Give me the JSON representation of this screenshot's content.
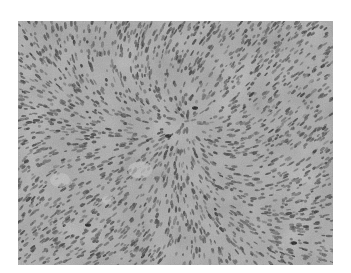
{
  "image": {
    "kind": "grayscale histology micrograph",
    "description": "Dense field of spindle-shaped cells arranged in fascicles",
    "colors": {
      "background": "#ffffff",
      "tissue_base": "#9a9a9a",
      "tissue_light": "#c4c4c4",
      "nucleus_dark": "#3a3a3a",
      "nucleus_darkest": "#1a1a1a"
    }
  }
}
